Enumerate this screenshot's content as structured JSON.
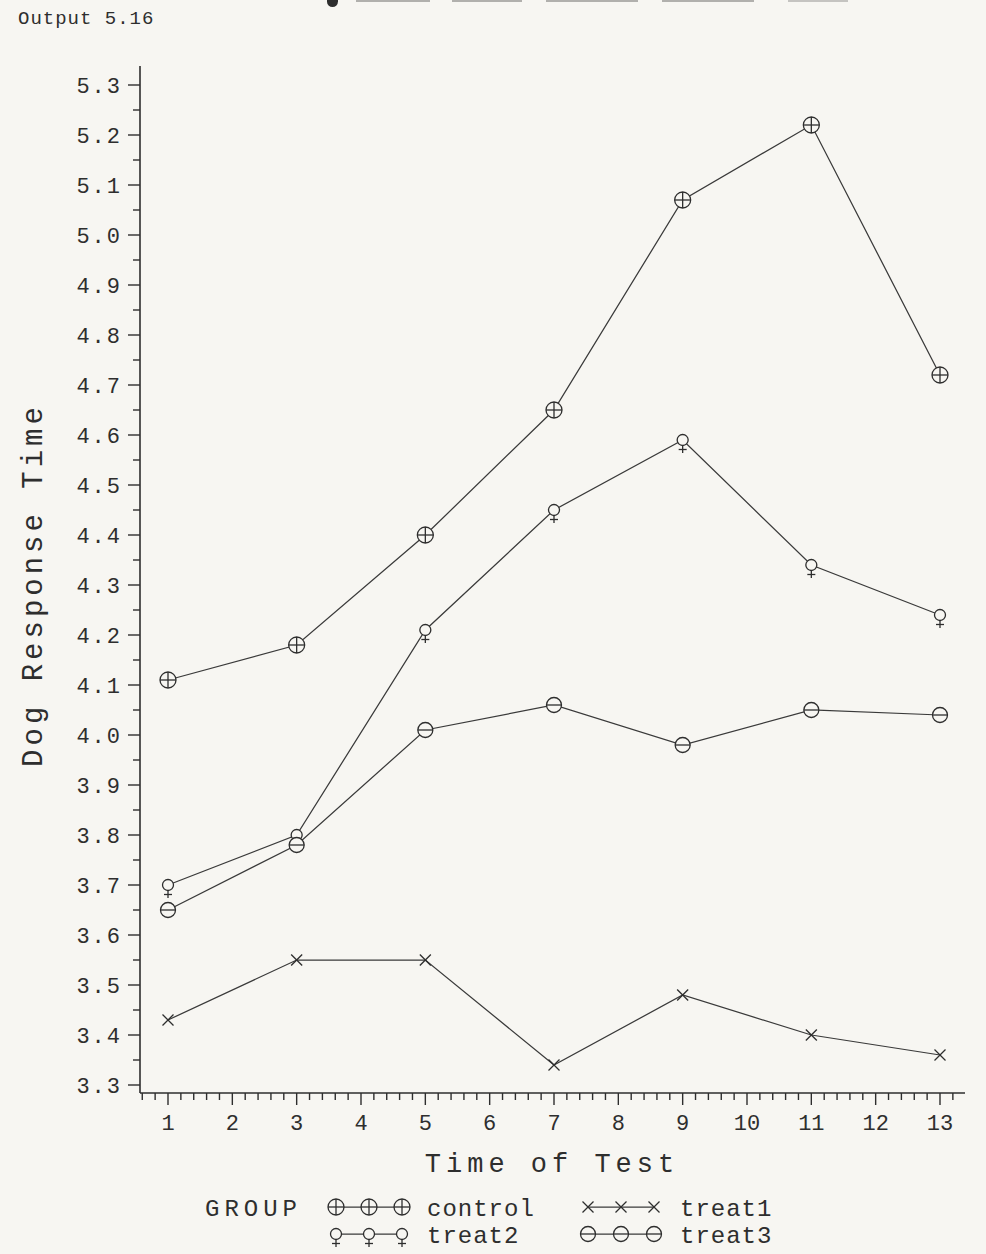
{
  "page": {
    "output_label": "Output 5.16"
  },
  "colors": {
    "ink": "#2e2e2e",
    "curve": "#3a3a3a",
    "background": "#f7f6f2"
  },
  "chart_data": {
    "type": "line",
    "x": [
      1,
      3,
      5,
      7,
      9,
      11,
      13
    ],
    "series": [
      {
        "name": "control",
        "marker": "circle-plus",
        "values": [
          4.11,
          4.18,
          4.4,
          4.65,
          5.07,
          5.22,
          4.72
        ]
      },
      {
        "name": "treat1",
        "marker": "x-cross",
        "values": [
          3.43,
          3.55,
          3.55,
          3.34,
          3.48,
          3.4,
          3.36
        ]
      },
      {
        "name": "treat2",
        "marker": "female",
        "values": [
          3.7,
          3.8,
          4.21,
          4.45,
          4.59,
          4.34,
          4.24
        ]
      },
      {
        "name": "treat3",
        "marker": "circle-minus",
        "values": [
          3.65,
          3.78,
          4.01,
          4.06,
          3.98,
          4.05,
          4.04
        ]
      }
    ],
    "title": "",
    "xlabel": "Time of Test",
    "ylabel": "Dog Response Time",
    "xticks": [
      1,
      2,
      3,
      4,
      5,
      6,
      7,
      8,
      9,
      10,
      11,
      12,
      13
    ],
    "xminor_step": 0.2,
    "ylim": [
      3.3,
      5.3
    ],
    "ytick_step": 0.1,
    "yminor_step": 0.05,
    "grid": false,
    "legend": {
      "title": "GROUP",
      "position": "bottom",
      "entries": [
        {
          "label": "control",
          "marker": "circle-plus"
        },
        {
          "label": "treat1",
          "marker": "x-cross"
        },
        {
          "label": "treat2",
          "marker": "female"
        },
        {
          "label": "treat3",
          "marker": "circle-minus"
        }
      ]
    }
  }
}
